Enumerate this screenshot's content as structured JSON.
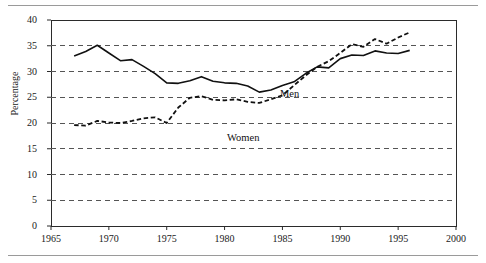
{
  "figure": {
    "axis_title": "Percentage",
    "top_rule_color": "#9a9a9a",
    "bottom_rule_color": "#9a9a9a",
    "line_color": "#111111",
    "grid_color": "#555555"
  },
  "labels": {
    "men": "Men",
    "women": "Women"
  },
  "chart_data": {
    "type": "line",
    "title": "",
    "xlabel": "",
    "ylabel": "Percentage",
    "xlim": [
      1965,
      2000
    ],
    "ylim": [
      0,
      40
    ],
    "xticks": [
      1965,
      1970,
      1975,
      1980,
      1985,
      1990,
      1995,
      2000
    ],
    "xticklabels": [
      "1965",
      "1970",
      "1975",
      "1980",
      "1985",
      "1990",
      "1995",
      "2000"
    ],
    "yticks": [
      0,
      5,
      10,
      15,
      20,
      25,
      30,
      35,
      40
    ],
    "yticklabels": [
      "0",
      "5",
      "10",
      "15",
      "20",
      "25",
      "30",
      "35",
      "40"
    ],
    "grid": "horizontal-dashed",
    "legend": "inline-annotations",
    "series": [
      {
        "name": "Men",
        "style": "solid",
        "x": [
          1967,
          1968,
          1969,
          1970,
          1971,
          1972,
          1973,
          1974,
          1975,
          1976,
          1977,
          1978,
          1979,
          1980,
          1981,
          1982,
          1983,
          1984,
          1985,
          1986,
          1987,
          1988,
          1989,
          1990,
          1991,
          1992,
          1993,
          1994,
          1995,
          1996
        ],
        "values": [
          33.0,
          33.9,
          35.1,
          33.6,
          32.1,
          32.3,
          31.0,
          29.6,
          27.8,
          27.7,
          28.2,
          29.0,
          28.1,
          27.8,
          27.7,
          27.2,
          26.0,
          26.4,
          27.3,
          28.0,
          29.6,
          30.9,
          30.7,
          32.5,
          33.2,
          33.1,
          34.0,
          33.6,
          33.5,
          34.1
        ]
      },
      {
        "name": "Women",
        "style": "dashed",
        "x": [
          1967,
          1968,
          1969,
          1970,
          1971,
          1972,
          1973,
          1974,
          1975,
          1976,
          1977,
          1978,
          1979,
          1980,
          1981,
          1982,
          1983,
          1984,
          1985,
          1986,
          1987,
          1988,
          1989,
          1990,
          1991,
          1992,
          1993,
          1994,
          1995,
          1996
        ],
        "values": [
          19.6,
          19.5,
          20.4,
          20.1,
          20.0,
          20.4,
          20.9,
          21.1,
          20.0,
          23.0,
          24.9,
          25.2,
          24.5,
          24.4,
          24.6,
          24.1,
          23.9,
          24.6,
          25.4,
          27.3,
          29.2,
          30.9,
          32.0,
          33.6,
          35.3,
          34.8,
          36.3,
          35.4,
          36.6,
          37.6
        ]
      }
    ]
  }
}
